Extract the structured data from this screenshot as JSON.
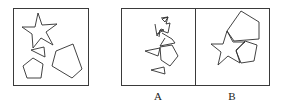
{
  "figure": {
    "given_panel": {
      "shapes": [
        "star",
        "triangle",
        "small-pentagon",
        "large-pentagon"
      ]
    },
    "options": [
      {
        "label": "A",
        "shapes": [
          "triangles",
          "pentagon",
          "line-fragments"
        ]
      },
      {
        "label": "B",
        "shapes": [
          "large-pentagon",
          "star",
          "small-pentagon"
        ]
      }
    ],
    "colors": {
      "stroke": "#2e2e2e",
      "background": "#ffffff"
    }
  }
}
